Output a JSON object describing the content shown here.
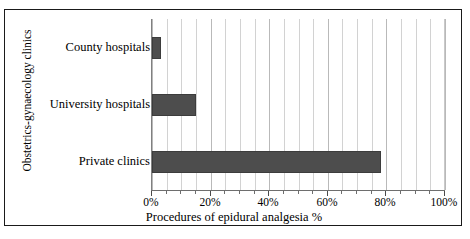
{
  "chart_data": {
    "type": "bar",
    "orientation": "horizontal",
    "title": "",
    "xlabel": "Procedures of epidural analgesia %",
    "ylabel": "Obstetrics-gynaecology clinics",
    "categories": [
      "County hospitals",
      "University hospitals",
      "Private clinics"
    ],
    "values": [
      3,
      15,
      78
    ],
    "value_unit": "%",
    "xlim": [
      0,
      100
    ],
    "xticks": [
      0,
      20,
      40,
      60,
      80,
      100
    ],
    "xtick_labels": [
      "0%",
      "20%",
      "40%",
      "60%",
      "80%",
      "100%"
    ],
    "minor_tick_step": 5,
    "grid": "vertical-minor-and-major",
    "legend": "none",
    "series": [
      {
        "name": "Procedures of epidural analgesia %",
        "values": [
          3,
          15,
          78
        ],
        "color": "#4d4d4d"
      }
    ],
    "colors": {
      "bar_fill": "#4d4d4d",
      "bar_edge": "#3c3c3c",
      "gridline": "#d2d2d2",
      "gridline_major": "#b9b9b9",
      "axis_line": "#6e6e6e",
      "frame": "#1a1a1a",
      "background": "#ffffff",
      "text": "#000000"
    }
  }
}
